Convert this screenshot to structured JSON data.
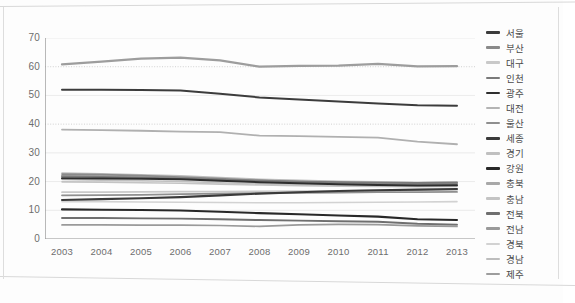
{
  "chart_data": {
    "type": "line",
    "title": "",
    "xlabel": "",
    "ylabel": "",
    "ylim": [
      0,
      70
    ],
    "ytick_values": [
      0,
      10,
      20,
      30,
      40,
      50,
      60,
      70
    ],
    "ytick_labels": [
      "0",
      "10",
      "20",
      "30",
      "40",
      "50",
      "60",
      "70"
    ],
    "grid": "horizontal-light-with-dotted-at-40-and-60",
    "legend_position": "right",
    "x": [
      "2003",
      "2004",
      "2005",
      "2006",
      "2007",
      "2008",
      "2009",
      "2010",
      "2011",
      "2012",
      "2013"
    ],
    "series": [
      {
        "name": "서울",
        "color": "#3c3c3c",
        "width": 2.0,
        "values": [
          52.0,
          52.0,
          51.9,
          51.7,
          50.6,
          49.3,
          48.6,
          47.9,
          47.2,
          46.6,
          46.4
        ]
      },
      {
        "name": "부산",
        "color": "#8a8a8a",
        "width": 1.7,
        "values": [
          22.6,
          22.4,
          22.1,
          21.6,
          21.0,
          20.4,
          20.0,
          19.6,
          19.4,
          19.2,
          19.3
        ]
      },
      {
        "name": "대구",
        "color": "#c9c9c9",
        "width": 1.7,
        "values": [
          16.3,
          16.3,
          16.4,
          16.5,
          16.5,
          16.6,
          16.7,
          16.8,
          16.9,
          17.0,
          17.1
        ]
      },
      {
        "name": "인천",
        "color": "#7a7a7a",
        "width": 1.8,
        "values": [
          21.8,
          21.6,
          21.4,
          21.1,
          20.7,
          20.3,
          20.0,
          19.8,
          19.6,
          19.5,
          19.6
        ]
      },
      {
        "name": "광주",
        "color": "#2e2e2e",
        "width": 2.0,
        "values": [
          21.2,
          21.1,
          21.0,
          20.8,
          20.3,
          19.8,
          19.4,
          19.1,
          18.8,
          18.6,
          18.7
        ]
      },
      {
        "name": "대전",
        "color": "#b4b4b4",
        "width": 1.6,
        "values": [
          22.2,
          22.0,
          21.8,
          21.4,
          20.9,
          20.4,
          20.1,
          19.9,
          19.7,
          19.6,
          19.8
        ]
      },
      {
        "name": "울산",
        "color": "#8f8f8f",
        "width": 1.8,
        "values": [
          15.2,
          15.3,
          15.4,
          15.6,
          15.8,
          16.0,
          16.1,
          16.2,
          16.3,
          16.3,
          16.4
        ]
      },
      {
        "name": "세종",
        "color": "#3a3a3a",
        "width": 2.1,
        "values": [
          13.6,
          13.9,
          14.2,
          14.6,
          15.2,
          15.8,
          16.3,
          16.7,
          17.0,
          17.2,
          17.4
        ]
      },
      {
        "name": "경기",
        "color": "#c0c0c0",
        "width": 1.6,
        "values": [
          20.7,
          20.5,
          20.3,
          20.0,
          19.6,
          19.2,
          18.9,
          18.7,
          18.5,
          18.4,
          18.5
        ]
      },
      {
        "name": "강원",
        "color": "#282828",
        "width": 2.1,
        "values": [
          10.3,
          10.2,
          10.1,
          9.9,
          9.5,
          9.0,
          8.6,
          8.2,
          7.8,
          6.9,
          6.6
        ]
      },
      {
        "name": "충북",
        "color": "#a8a8a8",
        "width": 1.7,
        "values": [
          22.0,
          21.8,
          21.5,
          21.1,
          20.5,
          19.9,
          19.5,
          19.2,
          19.0,
          18.8,
          18.9
        ]
      },
      {
        "name": "충남",
        "color": "#c4c4c4",
        "width": 1.6,
        "values": [
          19.9,
          19.8,
          19.6,
          19.4,
          19.1,
          18.8,
          18.6,
          18.4,
          18.3,
          18.2,
          18.3
        ]
      },
      {
        "name": "전북",
        "color": "#6f6f6f",
        "width": 1.9,
        "values": [
          7.3,
          7.3,
          7.2,
          7.1,
          6.9,
          6.6,
          6.4,
          6.2,
          6.0,
          5.3,
          5.0
        ]
      },
      {
        "name": "전남",
        "color": "#9a9a9a",
        "width": 1.7,
        "values": [
          4.9,
          4.9,
          4.8,
          4.8,
          4.7,
          4.4,
          4.9,
          5.1,
          5.0,
          4.6,
          4.4
        ]
      },
      {
        "name": "경북",
        "color": "#d2d2d2",
        "width": 1.6,
        "values": [
          13.0,
          13.0,
          12.9,
          12.8,
          12.7,
          12.6,
          12.6,
          12.7,
          12.8,
          12.9,
          13.0
        ]
      },
      {
        "name": "경남",
        "color": "#bdbdbd",
        "width": 1.6,
        "values": [
          23.0,
          22.7,
          22.4,
          22.0,
          21.4,
          20.8,
          20.4,
          20.1,
          19.9,
          19.7,
          19.8
        ]
      },
      {
        "name": "제주",
        "color": "#9d9d9d",
        "width": 2.2,
        "values": [
          60.8,
          61.8,
          62.8,
          63.2,
          62.2,
          60.0,
          60.3,
          60.4,
          61.0,
          60.1,
          60.2
        ]
      },
      {
        "name": "지방1",
        "color": "#b0b0b0",
        "width": 1.8,
        "values": [
          38.1,
          37.9,
          37.7,
          37.4,
          37.2,
          36.0,
          35.8,
          35.6,
          35.3,
          33.9,
          33.0
        ]
      }
    ]
  },
  "legend": {
    "items": [
      {
        "label": "서울",
        "color": "#3c3c3c"
      },
      {
        "label": "부산",
        "color": "#8a8a8a"
      },
      {
        "label": "대구",
        "color": "#c9c9c9"
      },
      {
        "label": "인천",
        "color": "#7a7a7a"
      },
      {
        "label": "광주",
        "color": "#2e2e2e"
      },
      {
        "label": "대전",
        "color": "#b4b4b4"
      },
      {
        "label": "울산",
        "color": "#8f8f8f"
      },
      {
        "label": "세종",
        "color": "#3a3a3a"
      },
      {
        "label": "경기",
        "color": "#c0c0c0"
      },
      {
        "label": "강원",
        "color": "#282828"
      },
      {
        "label": "충북",
        "color": "#a8a8a8"
      },
      {
        "label": "충남",
        "color": "#c4c4c4"
      },
      {
        "label": "전북",
        "color": "#6f6f6f"
      },
      {
        "label": "전남",
        "color": "#9a9a9a"
      },
      {
        "label": "경북",
        "color": "#d2d2d2"
      },
      {
        "label": "경남",
        "color": "#bdbdbd"
      },
      {
        "label": "제주",
        "color": "#9d9d9d"
      }
    ]
  }
}
